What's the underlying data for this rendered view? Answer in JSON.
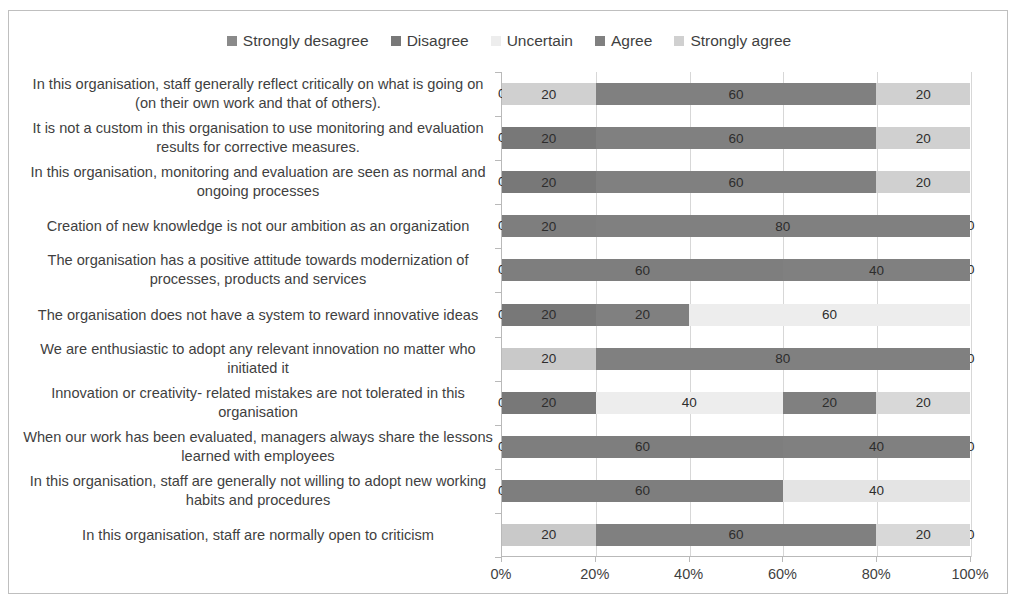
{
  "chart_data": {
    "type": "bar",
    "subtype": "stacked-horizontal-100pct",
    "title": "",
    "xlabel": "",
    "ylabel": "",
    "xlim": [
      0,
      100
    ],
    "x_ticks": [
      "0%",
      "20%",
      "40%",
      "60%",
      "80%",
      "100%"
    ],
    "x_tick_values": [
      0,
      20,
      40,
      60,
      80,
      100
    ],
    "grid": true,
    "legend_position": "top-center",
    "legend": [
      "Strongly desagree",
      "Disagree",
      "Uncertain",
      "Agree",
      "Strongly agree"
    ],
    "colors": {
      "strongly_desagree": "#8a8a8a",
      "disagree": "#787878",
      "uncertain": "#ededed",
      "agree": "#808080",
      "strongly_agree": "#d0d0d0"
    },
    "categories": [
      "In this organisation, staff generally reflect critically on what is going on (on their own work and that of others).",
      "It is not a custom in this organisation to use monitoring and evaluation results for corrective measures.",
      "In this organisation, monitoring and evaluation are seen as normal and ongoing processes",
      "Creation of new knowledge is not our ambition as an organization",
      "The organisation has a positive attitude towards modernization of processes, products and services",
      "The organisation does not have a system to reward innovative ideas",
      "We are enthusiastic to adopt any relevant innovation no matter who initiated it",
      "Innovation or creativity- related mistakes are not tolerated in this organisation",
      "When our work has been evaluated, managers always share the lessons learned with employees",
      "In this organisation, staff are generally not willing to adopt new working habits and procedures",
      "In this organisation, staff are normally open to criticism"
    ],
    "series": [
      {
        "name": "Strongly desagree",
        "color": "#8a8a8a",
        "values": [
          0,
          0,
          0,
          0,
          0,
          0,
          20,
          0,
          0,
          0,
          20
        ]
      },
      {
        "name": "Disagree",
        "color": "#787878",
        "values": [
          20,
          20,
          20,
          20,
          60,
          20,
          0,
          20,
          60,
          60,
          0
        ]
      },
      {
        "name": "Uncertain",
        "color": "#ededed",
        "values": [
          0,
          0,
          0,
          0,
          0,
          20,
          0,
          40,
          0,
          0,
          0
        ]
      },
      {
        "name": "Agree",
        "color": "#808080",
        "values": [
          60,
          60,
          60,
          80,
          40,
          0,
          80,
          20,
          40,
          0,
          60
        ]
      },
      {
        "name": "Strongly agree",
        "color": "#d0d0d0",
        "values": [
          20,
          20,
          20,
          0,
          0,
          60,
          0,
          20,
          0,
          40,
          20
        ]
      }
    ],
    "rows": [
      {
        "label": "In this organisation, staff generally reflect critically on what is going on (on their own work and that of others).",
        "segments": [
          {
            "series": "Strongly desagree",
            "value": 0,
            "label": "0",
            "color": "#8a8a8a"
          },
          {
            "series": "Disagree",
            "value": 20,
            "label": "20",
            "color": "#d0d0d0"
          },
          {
            "series": "Uncertain",
            "value": 0,
            "label": "",
            "color": "#ededed"
          },
          {
            "series": "Agree",
            "value": 60,
            "label": "60",
            "color": "#808080"
          },
          {
            "series": "Strongly agree",
            "value": 20,
            "label": "20",
            "color": "#d0d0d0"
          }
        ]
      },
      {
        "label": "It is not a custom in this organisation to use monitoring and evaluation results for corrective measures.",
        "segments": [
          {
            "series": "Strongly desagree",
            "value": 0,
            "label": "0",
            "color": "#8a8a8a"
          },
          {
            "series": "Disagree",
            "value": 20,
            "label": "20",
            "color": "#787878"
          },
          {
            "series": "Uncertain",
            "value": 0,
            "label": "0",
            "color": "#ededed"
          },
          {
            "series": "Agree",
            "value": 60,
            "label": "60",
            "color": "#808080"
          },
          {
            "series": "Strongly agree",
            "value": 20,
            "label": "20",
            "color": "#d0d0d0"
          }
        ]
      },
      {
        "label": "In this organisation, monitoring and evaluation are seen as normal and ongoing processes",
        "segments": [
          {
            "series": "Strongly desagree",
            "value": 0,
            "label": "0",
            "color": "#8a8a8a"
          },
          {
            "series": "Disagree",
            "value": 20,
            "label": "20",
            "color": "#787878"
          },
          {
            "series": "Uncertain",
            "value": 0,
            "label": "0",
            "color": "#ededed"
          },
          {
            "series": "Agree",
            "value": 60,
            "label": "60",
            "color": "#808080"
          },
          {
            "series": "Strongly agree",
            "value": 20,
            "label": "20",
            "color": "#d0d0d0"
          }
        ]
      },
      {
        "label": "Creation of new knowledge is not our ambition as an organization",
        "segments": [
          {
            "series": "Strongly desagree",
            "value": 0,
            "label": "0",
            "color": "#8a8a8a"
          },
          {
            "series": "Disagree",
            "value": 20,
            "label": "20",
            "color": "#7e7e7e"
          },
          {
            "series": "Uncertain",
            "value": 0,
            "label": "0",
            "color": "#ededed"
          },
          {
            "series": "Agree",
            "value": 80,
            "label": "80",
            "color": "#808080"
          },
          {
            "series": "Strongly agree",
            "value": 0,
            "label": "0",
            "color": "#d0d0d0"
          }
        ]
      },
      {
        "label": "The organisation has a positive attitude towards modernization of processes, products and services",
        "segments": [
          {
            "series": "Strongly desagree",
            "value": 0,
            "label": "0",
            "color": "#8a8a8a"
          },
          {
            "series": "Disagree",
            "value": 60,
            "label": "60",
            "color": "#7e7e7e"
          },
          {
            "series": "Uncertain",
            "value": 0,
            "label": "0",
            "color": "#ededed"
          },
          {
            "series": "Agree",
            "value": 40,
            "label": "40",
            "color": "#808080"
          },
          {
            "series": "Strongly agree",
            "value": 0,
            "label": "0",
            "color": "#d0d0d0"
          }
        ]
      },
      {
        "label": "The organisation does not have a system to reward innovative ideas",
        "segments": [
          {
            "series": "Strongly desagree",
            "value": 0,
            "label": "0",
            "color": "#8a8a8a"
          },
          {
            "series": "Disagree",
            "value": 20,
            "label": "20",
            "color": "#787878"
          },
          {
            "series": "Uncertain",
            "value": 0,
            "label": "0",
            "color": "#ededed"
          },
          {
            "series": "Agree",
            "value": 20,
            "label": "20",
            "color": "#808080"
          },
          {
            "series": "Strongly agree",
            "value": 60,
            "label": "60",
            "color": "#ededed"
          }
        ]
      },
      {
        "label": "We are enthusiastic to adopt any relevant innovation no matter who initiated it",
        "segments": [
          {
            "series": "Strongly desagree",
            "value": 20,
            "label": "20",
            "color": "#c9c9c9"
          },
          {
            "series": "Disagree",
            "value": 0,
            "label": "",
            "color": "#787878"
          },
          {
            "series": "Uncertain",
            "value": 0,
            "label": "",
            "color": "#ededed"
          },
          {
            "series": "Agree",
            "value": 80,
            "label": "80",
            "color": "#808080"
          },
          {
            "series": "Strongly agree",
            "value": 0,
            "label": "0",
            "color": "#d0d0d0"
          }
        ]
      },
      {
        "label": "Innovation or creativity- related mistakes are not tolerated in this organisation",
        "segments": [
          {
            "series": "Strongly desagree",
            "value": 0,
            "label": "0",
            "color": "#8a8a8a"
          },
          {
            "series": "Disagree",
            "value": 20,
            "label": "20",
            "color": "#787878"
          },
          {
            "series": "Uncertain",
            "value": 40,
            "label": "40",
            "color": "#ededed"
          },
          {
            "series": "Agree",
            "value": 20,
            "label": "20",
            "color": "#808080"
          },
          {
            "series": "Strongly agree",
            "value": 20,
            "label": "20",
            "color": "#d8d8d8"
          }
        ]
      },
      {
        "label": "When our work has been evaluated, managers always share the lessons learned with employees",
        "segments": [
          {
            "series": "Strongly desagree",
            "value": 0,
            "label": "0",
            "color": "#8a8a8a"
          },
          {
            "series": "Disagree",
            "value": 60,
            "label": "60",
            "color": "#7e7e7e"
          },
          {
            "series": "Uncertain",
            "value": 0,
            "label": "0",
            "color": "#ededed"
          },
          {
            "series": "Agree",
            "value": 40,
            "label": "40",
            "color": "#808080"
          },
          {
            "series": "Strongly agree",
            "value": 0,
            "label": "0",
            "color": "#d0d0d0"
          }
        ]
      },
      {
        "label": "In this organisation, staff are generally not willing to adopt new working habits and procedures",
        "segments": [
          {
            "series": "Strongly desagree",
            "value": 0,
            "label": "0",
            "color": "#8a8a8a"
          },
          {
            "series": "Disagree",
            "value": 60,
            "label": "60",
            "color": "#7e7e7e"
          },
          {
            "series": "Uncertain",
            "value": 0,
            "label": "",
            "color": "#ededed"
          },
          {
            "series": "Agree",
            "value": 0,
            "label": "",
            "color": "#808080"
          },
          {
            "series": "Strongly agree",
            "value": 40,
            "label": "40",
            "color": "#e4e4e4"
          }
        ]
      },
      {
        "label": "In this organisation, staff are normally open to criticism",
        "segments": [
          {
            "series": "Strongly desagree",
            "value": 20,
            "label": "20",
            "color": "#c9c9c9"
          },
          {
            "series": "Disagree",
            "value": 0,
            "label": "",
            "color": "#787878"
          },
          {
            "series": "Uncertain",
            "value": 0,
            "label": "",
            "color": "#ededed"
          },
          {
            "series": "Agree",
            "value": 60,
            "label": "60",
            "color": "#808080"
          },
          {
            "series": "Strongly agree",
            "value": 20,
            "label": "20",
            "color": "#d8d8d8"
          },
          {
            "series": "end",
            "value": 0,
            "label": "0",
            "color": "transparent"
          }
        ]
      }
    ]
  }
}
